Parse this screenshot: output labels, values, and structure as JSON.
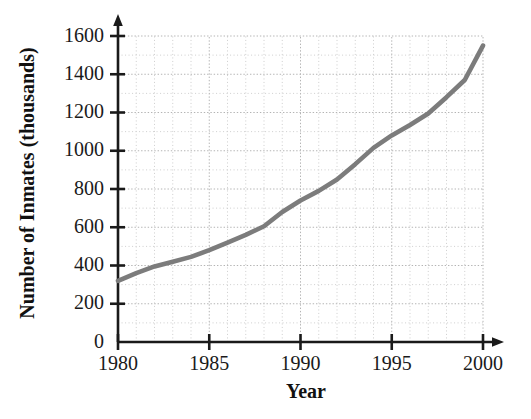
{
  "chart_data": {
    "type": "line",
    "title": "",
    "xlabel": "Year",
    "ylabel": "Number of Inmates (thousands)",
    "xlim": [
      1980,
      2000
    ],
    "ylim": [
      0,
      1600
    ],
    "grid": true,
    "legend": "none",
    "line_color": "#7c7c7c",
    "axis_color": "#1a1a1a",
    "grid_color": "#c8c8c8",
    "background": "#ffffff",
    "xticks": [
      1980,
      1985,
      1990,
      1995,
      2000
    ],
    "xtick_labels": [
      "1980",
      "1985",
      "1990",
      "1995",
      "2000"
    ],
    "yticks": [
      0,
      200,
      400,
      600,
      800,
      1000,
      1200,
      1400,
      1600
    ],
    "ytick_labels": [
      "0",
      "200",
      "400",
      "600",
      "800",
      "1000",
      "1200",
      "1400",
      "1600"
    ],
    "x": [
      1980,
      1981,
      1982,
      1983,
      1984,
      1985,
      1986,
      1987,
      1988,
      1989,
      1990,
      1991,
      1992,
      1993,
      1994,
      1995,
      1996,
      1997,
      1998,
      1999,
      2000
    ],
    "values": [
      320,
      360,
      395,
      420,
      445,
      480,
      520,
      560,
      605,
      680,
      740,
      790,
      850,
      930,
      1015,
      1080,
      1135,
      1195,
      1280,
      1370,
      1550
    ],
    "series": [
      {
        "name": "Number of Inmates (thousands)",
        "values": [
          320,
          360,
          395,
          420,
          445,
          480,
          520,
          560,
          605,
          680,
          740,
          790,
          850,
          930,
          1015,
          1080,
          1135,
          1195,
          1280,
          1370,
          1550
        ]
      }
    ]
  }
}
